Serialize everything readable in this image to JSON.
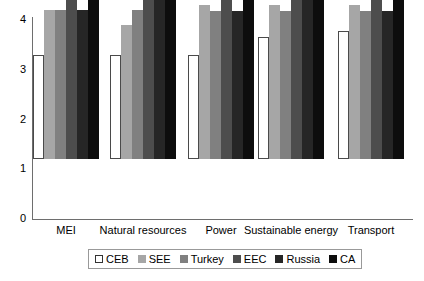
{
  "chart_data": {
    "type": "bar",
    "title": "",
    "subtitle": "",
    "xlabel": "",
    "ylabel": "",
    "ylim": [
      0,
      4
    ],
    "yticks": [
      0,
      1,
      2,
      3,
      4
    ],
    "ytick_labels": [
      "0",
      "1",
      "2",
      "3",
      "4"
    ],
    "grid": false,
    "legend_position": "bottom",
    "categories": [
      "MEI",
      "Natural resources",
      "Power",
      "Sustainable energy",
      "Transport"
    ],
    "series": [
      {
        "name": "CEB",
        "color": "#ffffff",
        "values": [
          2.1,
          2.1,
          2.1,
          2.45,
          2.58
        ]
      },
      {
        "name": "SEE",
        "color": "#a6a6a6",
        "values": [
          3.0,
          2.7,
          3.1,
          3.1,
          3.1
        ]
      },
      {
        "name": "Turkey",
        "color": "#808080",
        "values": [
          3.0,
          3.0,
          2.98,
          2.98,
          2.98
        ]
      },
      {
        "name": "EEC",
        "color": "#4d4d4d",
        "values": [
          3.8,
          3.45,
          3.45,
          3.62,
          3.45
        ]
      },
      {
        "name": "Russia",
        "color": "#262626",
        "values": [
          3.0,
          4.0,
          2.98,
          4.0,
          2.98
        ]
      },
      {
        "name": "CA",
        "color": "#0d0d0d",
        "values": [
          4.0,
          3.8,
          3.8,
          4.0,
          3.8
        ]
      }
    ]
  },
  "legend": {
    "items": [
      {
        "label": "CEB"
      },
      {
        "label": "SEE"
      },
      {
        "label": "Turkey"
      },
      {
        "label": "EEC"
      },
      {
        "label": "Russia"
      },
      {
        "label": "CA"
      }
    ]
  }
}
